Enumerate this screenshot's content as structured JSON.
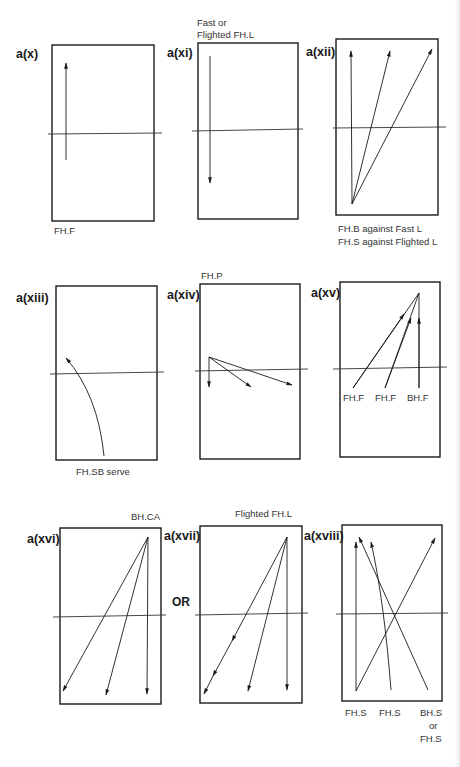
{
  "figure": {
    "panels": [
      {
        "id": "a(x)",
        "label": "a(x)",
        "caption_top": "",
        "captions_bottom": [
          "FH.F"
        ]
      },
      {
        "id": "a(xi)",
        "label": "a(xi)",
        "caption_top_lines": [
          "Fast or",
          "Flighted FH.L"
        ],
        "captions_bottom": []
      },
      {
        "id": "a(xii)",
        "label": "a(xii)",
        "caption_top": "",
        "captions_bottom": [
          "FH.B against Fast L",
          "FH.S against Flighted L"
        ]
      },
      {
        "id": "a(xiii)",
        "label": "a(xiii)",
        "caption_top": "",
        "captions_bottom": [
          "FH.SB serve"
        ]
      },
      {
        "id": "a(xiv)",
        "label": "a(xiv)",
        "caption_top": "FH.P",
        "captions_bottom": []
      },
      {
        "id": "a(xv)",
        "label": "a(xv)",
        "caption_top": "",
        "shot_labels": [
          "FH.F",
          "FH.F",
          "BH.F"
        ]
      },
      {
        "id": "a(xvi)",
        "label": "a(xvi)",
        "caption_top": "BH.CA",
        "captions_bottom": []
      },
      {
        "id": "a(xvii)",
        "label": "a(xvii)",
        "caption_top": "Flighted FH.L",
        "captions_bottom": []
      },
      {
        "id": "a(xviii)",
        "label": "a(xviii)",
        "caption_top": "",
        "shot_labels": [
          "FH.S",
          "FH.S",
          "BH.S"
        ],
        "shot_label_extra": [
          "or",
          "FH.S"
        ]
      }
    ],
    "connector_text": "OR",
    "colors": {
      "ink": "#1a1a1a",
      "paper": "#ffffff"
    }
  }
}
